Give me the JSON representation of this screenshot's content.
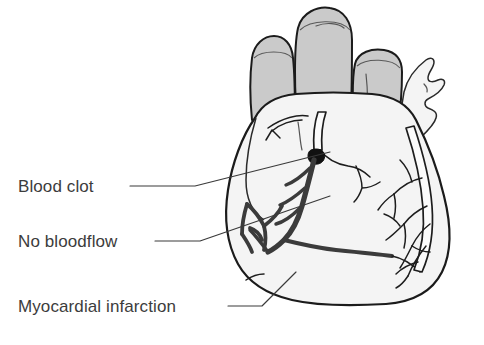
{
  "figure": {
    "background_color": "#ffffff",
    "ink_color": "#3a3a3a",
    "organ_fill_color": "#f4f4f4",
    "vessel_stump_color": "#cacaca",
    "clot_color": "#111111",
    "blocked_artery_color": "#3b3b3b"
  },
  "labels": [
    {
      "id": "blood-clot",
      "text": "Blood clot",
      "x": 18,
      "y": 189,
      "points_to": "dark occlusion on the anterior interventricular artery"
    },
    {
      "id": "no-bloodflow",
      "text": "No bloodflow",
      "x": 18,
      "y": 244,
      "points_to": "darkened artery segment below the clot"
    },
    {
      "id": "myocardial-infarction",
      "text": "Myocardial infarction",
      "x": 18,
      "y": 309,
      "points_to": "affected lower left myocardium"
    }
  ],
  "parts": [
    {
      "id": "vessel-stump-left",
      "name": "cut great vessel (left stump)"
    },
    {
      "id": "vessel-stump-center",
      "name": "cut great vessel (center stump)"
    },
    {
      "id": "vessel-stump-right",
      "name": "cut great vessel (right stump)"
    },
    {
      "id": "auricle",
      "name": "atrial appendage"
    },
    {
      "id": "coronary-tree-right",
      "name": "patent coronary artery tree"
    },
    {
      "id": "coronary-artery-open",
      "name": "open coronary artery above clot"
    },
    {
      "id": "coronary-artery-blocked",
      "name": "occluded coronary artery below clot"
    },
    {
      "id": "clot",
      "name": "blood clot / thrombus"
    },
    {
      "id": "infarct-branches",
      "name": "darkened branches in infarcted region"
    }
  ]
}
